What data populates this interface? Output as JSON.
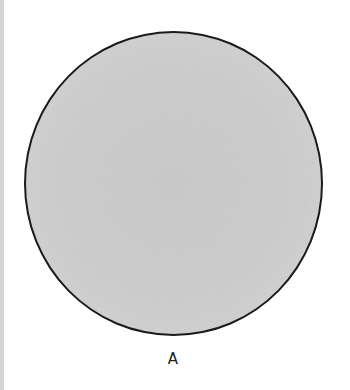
{
  "figure": {
    "shape": "circle",
    "label": "A",
    "colors": {
      "fill": "#cdcdcd",
      "outline": "#1a1a1a",
      "background": "#ffffff",
      "left_strip": "#d4d4d4"
    }
  }
}
